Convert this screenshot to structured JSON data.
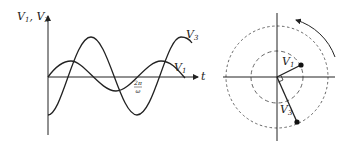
{
  "waveform_graph": {
    "y_axis_label_v1": "V",
    "y_axis_label_v1_sub": "1",
    "y_axis_label_sep": ", ",
    "y_axis_label_v3": "V",
    "y_axis_label_v3_sub": "3",
    "x_axis_label": "t",
    "period_label_num": "2π",
    "period_label_den": "ω",
    "curve_v3_label": "V",
    "curve_v3_sub": "3",
    "curve_v1_label": "V",
    "curve_v1_sub": "1"
  },
  "phasor_diagram": {
    "vector_v1_label": "V",
    "vector_v1_sub": "1",
    "vector_v3_label": "V",
    "vector_v3_sub": "3",
    "rotation_direction": "counterclockwise"
  },
  "colors": {
    "line": "#222222",
    "dashed": "#555555",
    "background": "#ffffff"
  }
}
